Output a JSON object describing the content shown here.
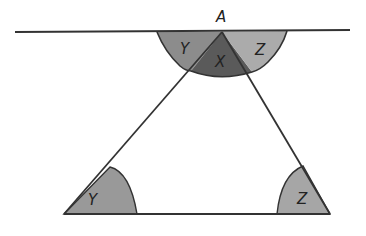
{
  "diagram": {
    "labels": {
      "apex": "A",
      "top_left_angle": "Y",
      "top_middle_angle": "X",
      "top_right_angle": "Z",
      "bottom_left_angle": "Y",
      "bottom_right_angle": "Z"
    },
    "colors": {
      "line": "#333333",
      "angle_y_top": "#8c8c8c",
      "angle_x": "#5a5a5a",
      "angle_z_top": "#ababab",
      "angle_y_bottom": "#999999",
      "angle_z_bottom": "#a6a6a6"
    },
    "points": {
      "A": [
        222,
        32
      ],
      "B": [
        64,
        214
      ],
      "C": [
        330,
        214
      ]
    },
    "top_line": {
      "x1": 15,
      "y1": 32,
      "x2": 350,
      "y2": 30
    }
  }
}
